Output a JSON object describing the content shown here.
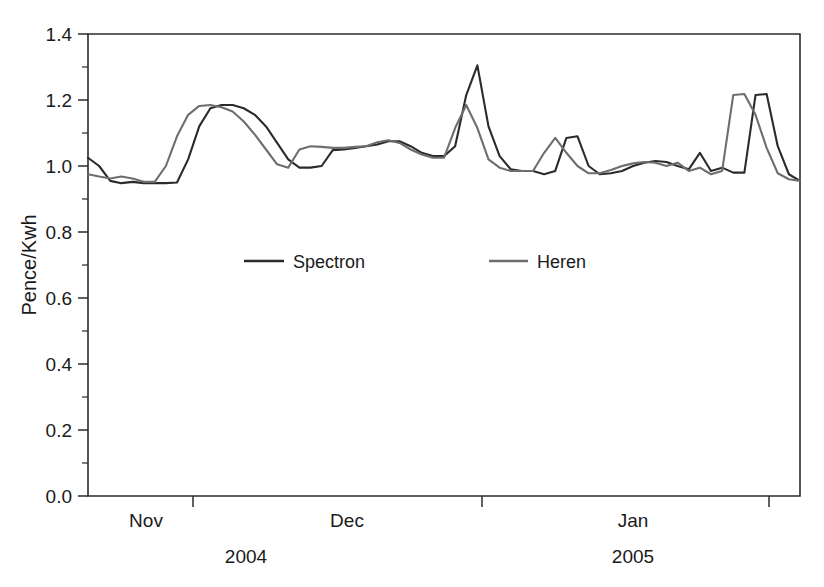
{
  "chart_data": {
    "type": "line",
    "title": "",
    "xlabel": "",
    "ylabel": "Pence/Kwh",
    "ylim": [
      0.0,
      1.4
    ],
    "ytick_labels": [
      "0.0",
      "0.2",
      "0.4",
      "0.6",
      "0.8",
      "1.0",
      "1.2",
      "1.4"
    ],
    "ytick_values": [
      0.0,
      0.2,
      0.4,
      0.6,
      0.8,
      1.0,
      1.2,
      1.4
    ],
    "yminor_step": 0.1,
    "grid": false,
    "legend_position": "inside-center",
    "xtick_group_labels": [
      "Nov",
      "Dec",
      "Jan"
    ],
    "xtick_year_labels": [
      "2004",
      "2005"
    ],
    "xtick_boundaries_px": [
      193,
      482,
      769
    ],
    "xlim_index": [
      0,
      64
    ],
    "x": [
      0,
      1,
      2,
      3,
      4,
      5,
      6,
      7,
      8,
      9,
      10,
      11,
      12,
      13,
      14,
      15,
      16,
      17,
      18,
      19,
      20,
      21,
      22,
      23,
      24,
      25,
      26,
      27,
      28,
      29,
      30,
      31,
      32,
      33,
      34,
      35,
      36,
      37,
      38,
      39,
      40,
      41,
      42,
      43,
      44,
      45,
      46,
      47,
      48,
      49,
      50,
      51,
      52,
      53,
      54,
      55,
      56,
      57,
      58,
      59,
      60,
      61,
      62,
      63,
      64
    ],
    "series": [
      {
        "name": "Spectron",
        "color": "#2b2b2b",
        "values": [
          1.025,
          1.0,
          0.955,
          0.948,
          0.952,
          0.948,
          0.948,
          0.948,
          0.95,
          1.02,
          1.12,
          1.175,
          1.185,
          1.185,
          1.175,
          1.155,
          1.12,
          1.07,
          1.02,
          0.995,
          0.995,
          1.0,
          1.048,
          1.05,
          1.055,
          1.06,
          1.065,
          1.075,
          1.075,
          1.06,
          1.04,
          1.03,
          1.03,
          1.06,
          1.215,
          1.305,
          1.12,
          1.03,
          0.99,
          0.985,
          0.985,
          0.975,
          0.985,
          1.085,
          1.09,
          1.0,
          0.975,
          0.978,
          0.985,
          1.0,
          1.01,
          1.015,
          1.012,
          1.0,
          0.99,
          1.04,
          0.985,
          0.995,
          0.98,
          0.98,
          1.215,
          1.218,
          1.06,
          0.975,
          0.955
        ]
      },
      {
        "name": "Heren",
        "color": "#6e6e6e",
        "values": [
          0.975,
          0.968,
          0.962,
          0.968,
          0.962,
          0.952,
          0.952,
          1.0,
          1.09,
          1.155,
          1.182,
          1.185,
          1.178,
          1.165,
          1.135,
          1.095,
          1.05,
          1.005,
          0.995,
          1.05,
          1.06,
          1.058,
          1.055,
          1.055,
          1.058,
          1.06,
          1.072,
          1.078,
          1.07,
          1.05,
          1.035,
          1.025,
          1.025,
          1.115,
          1.185,
          1.115,
          1.02,
          0.995,
          0.985,
          0.985,
          0.985,
          1.04,
          1.085,
          1.04,
          1.0,
          0.978,
          0.978,
          0.988,
          1.0,
          1.008,
          1.012,
          1.01,
          1.0,
          1.01,
          0.985,
          0.995,
          0.975,
          0.985,
          1.215,
          1.218,
          1.155,
          1.055,
          0.978,
          0.96,
          0.955
        ]
      }
    ]
  },
  "legend": {
    "entries": [
      {
        "label": "Spectron",
        "color": "#2b2b2b"
      },
      {
        "label": "Heren",
        "color": "#6e6e6e"
      }
    ]
  },
  "axes": {
    "y_title": "Pence/Kwh",
    "y_labels": [
      "1.4",
      "1.2",
      "1.0",
      "0.8",
      "0.6",
      "0.4",
      "0.2",
      "0.0"
    ],
    "x_month_labels": [
      "Nov",
      "Dec",
      "Jan"
    ],
    "x_year_labels": [
      "2004",
      "2005"
    ]
  }
}
